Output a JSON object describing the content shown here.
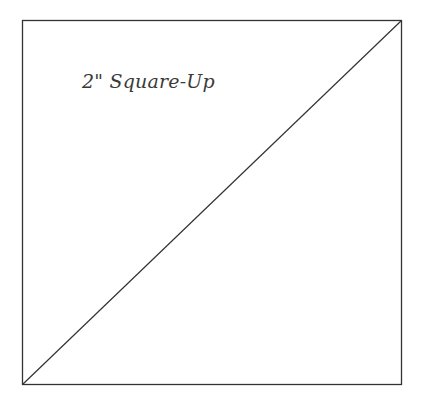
{
  "diagram": {
    "label": "2\" Square-Up",
    "shape": "square-with-diagonal",
    "stroke_color": "#333333",
    "square": {
      "x": 22,
      "y": 20,
      "width": 379,
      "height": 364
    },
    "diagonal": {
      "from": "bottom-left",
      "to": "top-right"
    }
  }
}
